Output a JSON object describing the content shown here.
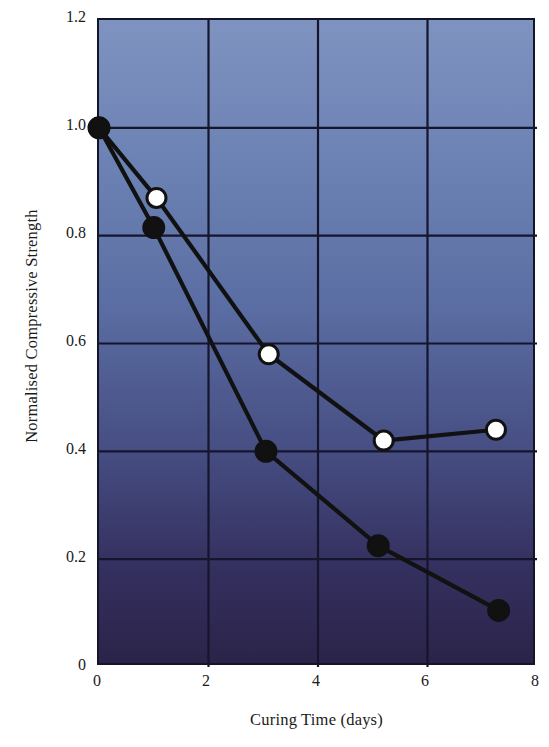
{
  "chart_data": {
    "type": "line",
    "title": "",
    "xlabel": "Curing Time (days)",
    "ylabel": "Normalised Compressive Strength",
    "xlim": [
      0,
      8
    ],
    "ylim": [
      0,
      1.2
    ],
    "xticks": [
      "0",
      "2",
      "4",
      "6",
      "8"
    ],
    "xtick_values": [
      0,
      2,
      4,
      6,
      8
    ],
    "yticks": [
      "0",
      "0.2",
      "0.4",
      "0.6",
      "0.8",
      "1.0",
      "1.2"
    ],
    "ytick_values": [
      0,
      0.2,
      0.4,
      0.6,
      0.8,
      1.0,
      1.2
    ],
    "grid": true,
    "legend": null,
    "legend_position": "none",
    "plot_background": "#5b6ea3",
    "series": [
      {
        "name": "open-circle-series",
        "marker": "circle-open",
        "marker_face_color": "#ffffff",
        "marker_edge_color": "#111111",
        "line_color": "#111111",
        "x": [
          0,
          1.05,
          3.1,
          5.2,
          7.25
        ],
        "y": [
          1.0,
          0.87,
          0.58,
          0.42,
          0.44
        ]
      },
      {
        "name": "filled-circle-series",
        "marker": "circle-filled",
        "marker_face_color": "#111111",
        "marker_edge_color": "#111111",
        "line_color": "#111111",
        "x": [
          0,
          1.0,
          3.05,
          5.1,
          7.3
        ],
        "y": [
          1.0,
          0.815,
          0.4,
          0.225,
          0.105
        ]
      }
    ]
  }
}
